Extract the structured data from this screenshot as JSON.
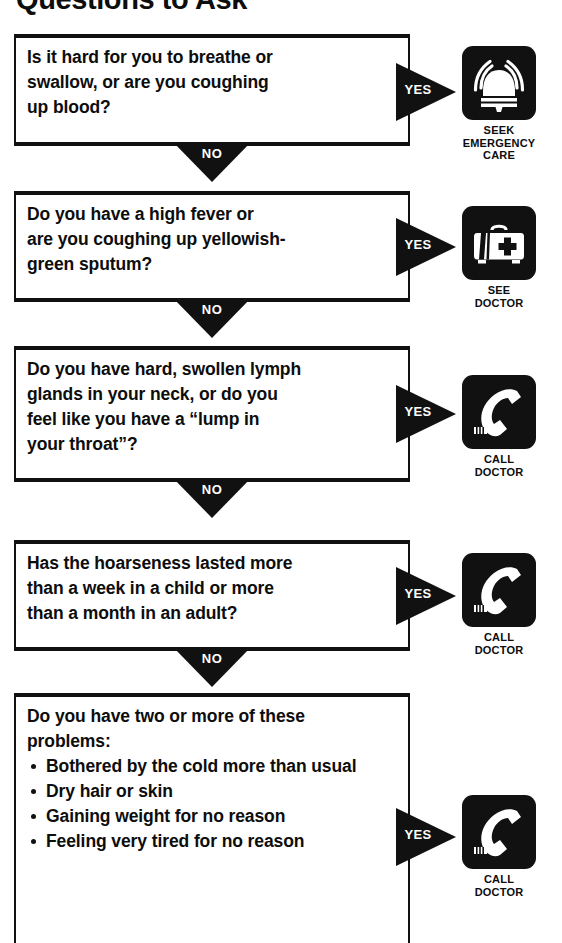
{
  "page": {
    "title": "Questions to Ask",
    "yes_label": "YES",
    "no_label": "NO"
  },
  "flow": {
    "questions": [
      {
        "id": "breathing-swallow-blood",
        "lines": [
          "Is it hard for you to breathe or",
          "swallow, or are you coughing",
          "up blood?"
        ],
        "bullets": [],
        "yes_label": "YES",
        "no_label": "NO",
        "outcome": {
          "icon": "alarm-bell-icon",
          "caption_lines": [
            "SEEK",
            "EMERGENCY",
            "CARE"
          ]
        }
      },
      {
        "id": "fever-sputum",
        "lines": [
          "Do you have a high fever or",
          "are you coughing up yellowish-",
          "green sputum?"
        ],
        "bullets": [],
        "yes_label": "YES",
        "no_label": "NO",
        "outcome": {
          "icon": "medical-bag-icon",
          "caption_lines": [
            "SEE",
            "DOCTOR"
          ]
        }
      },
      {
        "id": "lymph-glands-lump",
        "lines": [
          "Do you have hard, swollen lymph",
          "glands in your neck, or do you",
          "feel like you have a “lump in",
          "your throat”?"
        ],
        "bullets": [],
        "yes_label": "YES",
        "no_label": "NO",
        "outcome": {
          "icon": "telephone-icon",
          "caption_lines": [
            "CALL",
            "DOCTOR"
          ]
        }
      },
      {
        "id": "hoarseness-duration",
        "lines": [
          "Has the hoarseness lasted more",
          "than a week in a child or more",
          "than a month in an adult?"
        ],
        "bullets": [],
        "yes_label": "YES",
        "no_label": "NO",
        "outcome": {
          "icon": "telephone-icon",
          "caption_lines": [
            "CALL",
            "DOCTOR"
          ]
        }
      },
      {
        "id": "two-or-more-problems",
        "lines": [
          "Do you have two or more of these",
          "problems:"
        ],
        "bullets": [
          "Bothered by the cold more than usual",
          "Dry hair or skin",
          "Gaining weight for no reason",
          "Feeling very tired for no reason"
        ],
        "yes_label": "YES",
        "no_label": "",
        "outcome": {
          "icon": "telephone-icon",
          "caption_lines": [
            "CALL",
            "DOCTOR"
          ]
        }
      }
    ]
  },
  "colors": {
    "ink": "#111111",
    "paper": "#ffffff"
  }
}
